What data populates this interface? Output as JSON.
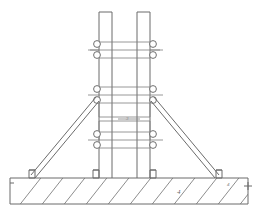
{
  "drawing": {
    "title": "Twin-column braced frame on concrete foundation",
    "canvas": {
      "width": 255,
      "height": 215
    },
    "background_color": "#ffffff",
    "line_color": "#6b6b6b",
    "hatch_color": "#707070",
    "annotations": [
      {
        "id": "anno-center",
        "label": "3",
        "x": 128,
        "y": 119
      },
      {
        "id": "anno-foundation",
        "label": "4",
        "x": 180,
        "y": 192
      },
      {
        "id": "anno-right-anchor",
        "label": "4",
        "x": 230,
        "y": 184
      }
    ],
    "columns": [
      {
        "id": "column-left",
        "x_left": 99,
        "x_right": 112,
        "y_top": 12,
        "y_bottom": 178
      },
      {
        "id": "column-right",
        "x_left": 137,
        "x_right": 150,
        "y_top": 12,
        "y_bottom": 178
      }
    ],
    "clamp_levels": [
      {
        "id": "clamp-level-top",
        "y": 50,
        "label": "top tie level"
      },
      {
        "id": "clamp-level-middle",
        "y": 95,
        "label": "middle tie level"
      },
      {
        "id": "clamp-level-lower",
        "y": 140,
        "label": "lower tie level"
      }
    ],
    "braces": [
      {
        "id": "brace-left",
        "from_x": 97,
        "from_y": 98,
        "to_x": 32,
        "to_y": 178
      },
      {
        "id": "brace-right",
        "from_x": 152,
        "from_y": 98,
        "to_x": 222,
        "to_y": 178
      }
    ],
    "foundation": {
      "id": "foundation-slab",
      "x": 10,
      "y": 178,
      "width": 238,
      "height": 26,
      "hatch_angle_deg": 45,
      "hatch_spacing": 22
    },
    "anchors": [
      {
        "id": "anchor-left-brace",
        "x": 29,
        "y": 171
      },
      {
        "id": "anchor-column-left",
        "x": 95,
        "y": 171
      },
      {
        "id": "anchor-column-right",
        "x": 150,
        "y": 171
      },
      {
        "id": "anchor-right-brace",
        "x": 218,
        "y": 171
      }
    ]
  }
}
